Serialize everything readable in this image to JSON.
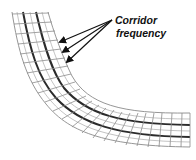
{
  "diagram": {
    "label": {
      "line1": "Corridor",
      "line2": "frequency"
    },
    "colors": {
      "background": "#ffffff",
      "grid_line": "#8a8a8a",
      "corridor_line": "#2b2b2b",
      "arrow": "#111111",
      "text": "#111111"
    },
    "elements": {
      "corridor_grid": "curved corridor mesh bending from top-left down to bottom-right",
      "center_lines": 2,
      "arrows": 3
    }
  }
}
